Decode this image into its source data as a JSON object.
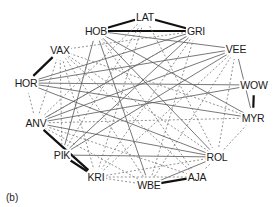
{
  "figure": {
    "panel_label": "(b)",
    "width": 278,
    "height": 207,
    "background_color": "#ffffff"
  },
  "chart_data": {
    "type": "graph",
    "title": "",
    "subtitle": "",
    "xlabel": "",
    "ylabel": "",
    "legend": [],
    "layout": "circular",
    "grid": false,
    "node_count": 15,
    "edge_count": 55,
    "edge_styles": {
      "thick": {
        "color": "#111111",
        "width": 2.2,
        "dash": "none",
        "meaning": "strong tie"
      },
      "solid": {
        "color": "#555555",
        "width": 0.8,
        "dash": "none",
        "meaning": "medium tie"
      },
      "dashed": {
        "color": "#777777",
        "width": 0.8,
        "dash": "2,2",
        "meaning": "weak tie"
      }
    },
    "nodes": [
      {
        "id": "LAT",
        "label": "LAT",
        "x": 145,
        "y": 17
      },
      {
        "id": "HOB",
        "label": "HOB",
        "x": 96,
        "y": 31
      },
      {
        "id": "GRI",
        "label": "GRI",
        "x": 196,
        "y": 31
      },
      {
        "id": "VEE",
        "label": "VEE",
        "x": 236,
        "y": 49
      },
      {
        "id": "WOW",
        "label": "WOW",
        "x": 254,
        "y": 85
      },
      {
        "id": "MYR",
        "label": "MYR",
        "x": 253,
        "y": 118
      },
      {
        "id": "ROL",
        "label": "ROL",
        "x": 217,
        "y": 157
      },
      {
        "id": "AJA",
        "label": "AJA",
        "x": 197,
        "y": 177
      },
      {
        "id": "WBE",
        "label": "WBE",
        "x": 149,
        "y": 185
      },
      {
        "id": "KRI",
        "label": "KRI",
        "x": 96,
        "y": 177
      },
      {
        "id": "PIK",
        "label": "PIK",
        "x": 62,
        "y": 155
      },
      {
        "id": "ANV",
        "label": "ANV",
        "x": 36,
        "y": 123
      },
      {
        "id": "HOR",
        "label": "HOR",
        "x": 26,
        "y": 83
      },
      {
        "id": "VAX",
        "label": "VAX",
        "x": 60,
        "y": 50
      },
      {
        "id": "MID",
        "label": "",
        "x": 140,
        "y": 118
      }
    ],
    "edges": [
      {
        "source": "LAT",
        "target": "HOB",
        "style": "thick"
      },
      {
        "source": "LAT",
        "target": "GRI",
        "style": "thick"
      },
      {
        "source": "HOB",
        "target": "GRI",
        "style": "thick"
      },
      {
        "source": "VAX",
        "target": "HOR",
        "style": "thick"
      },
      {
        "source": "WOW",
        "target": "MYR",
        "style": "thick"
      },
      {
        "source": "ANV",
        "target": "KRI",
        "style": "thick"
      },
      {
        "source": "PIK",
        "target": "KRI",
        "style": "thick"
      },
      {
        "source": "WBE",
        "target": "AJA",
        "style": "thick"
      },
      {
        "source": "HOB",
        "target": "VEE",
        "style": "solid"
      },
      {
        "source": "HOB",
        "target": "MYR",
        "style": "solid"
      },
      {
        "source": "HOB",
        "target": "ROL",
        "style": "solid"
      },
      {
        "source": "HOB",
        "target": "WBE",
        "style": "solid"
      },
      {
        "source": "GRI",
        "target": "ANV",
        "style": "solid"
      },
      {
        "source": "GRI",
        "target": "PIK",
        "style": "solid"
      },
      {
        "source": "GRI",
        "target": "HOR",
        "style": "solid"
      },
      {
        "source": "VEE",
        "target": "ANV",
        "style": "solid"
      },
      {
        "source": "VEE",
        "target": "HOR",
        "style": "solid"
      },
      {
        "source": "VEE",
        "target": "MYR",
        "style": "solid"
      },
      {
        "source": "VEE",
        "target": "PIK",
        "style": "solid"
      },
      {
        "source": "WOW",
        "target": "HOR",
        "style": "solid"
      },
      {
        "source": "WOW",
        "target": "ANV",
        "style": "solid"
      },
      {
        "source": "MYR",
        "target": "ANV",
        "style": "dashed"
      },
      {
        "source": "ROL",
        "target": "PIK",
        "style": "solid"
      },
      {
        "source": "ROL",
        "target": "ANV",
        "style": "solid"
      },
      {
        "source": "ROL",
        "target": "KRI",
        "style": "dashed"
      },
      {
        "source": "ROL",
        "target": "WBE",
        "style": "solid"
      },
      {
        "source": "ROL",
        "target": "AJA",
        "style": "dashed"
      },
      {
        "source": "ROL",
        "target": "VEE",
        "style": "dashed"
      },
      {
        "source": "ROL",
        "target": "MYR",
        "style": "dashed"
      },
      {
        "source": "AJA",
        "target": "KRI",
        "style": "dashed"
      },
      {
        "source": "AJA",
        "target": "VAX",
        "style": "dashed"
      },
      {
        "source": "AJA",
        "target": "HOB",
        "style": "dashed"
      },
      {
        "source": "WBE",
        "target": "KRI",
        "style": "dashed"
      },
      {
        "source": "WBE",
        "target": "VAX",
        "style": "dashed"
      },
      {
        "source": "WBE",
        "target": "GRI",
        "style": "dashed"
      },
      {
        "source": "WBE",
        "target": "VEE",
        "style": "dashed"
      },
      {
        "source": "KRI",
        "target": "VAX",
        "style": "dashed"
      },
      {
        "source": "KRI",
        "target": "LAT",
        "style": "dashed"
      },
      {
        "source": "KRI",
        "target": "VEE",
        "style": "dashed"
      },
      {
        "source": "PIK",
        "target": "VAX",
        "style": "dashed"
      },
      {
        "source": "PIK",
        "target": "LAT",
        "style": "dashed"
      },
      {
        "source": "PIK",
        "target": "HOB",
        "style": "solid"
      },
      {
        "source": "ANV",
        "target": "HOR",
        "style": "dashed"
      },
      {
        "source": "ANV",
        "target": "VAX",
        "style": "dashed"
      },
      {
        "source": "ANV",
        "target": "GRI",
        "style": "dashed"
      },
      {
        "source": "ANV",
        "target": "AJA",
        "style": "dashed"
      },
      {
        "source": "ANV",
        "target": "WBE",
        "style": "dashed"
      },
      {
        "source": "HOR",
        "target": "ROL",
        "style": "solid"
      },
      {
        "source": "HOR",
        "target": "MYR",
        "style": "solid"
      },
      {
        "source": "VAX",
        "target": "ROL",
        "style": "dashed"
      },
      {
        "source": "VAX",
        "target": "MYR",
        "style": "dashed"
      },
      {
        "source": "VAX",
        "target": "GRI",
        "style": "dashed"
      },
      {
        "source": "LAT",
        "target": "ANV",
        "style": "dashed"
      },
      {
        "source": "LAT",
        "target": "ROL",
        "style": "dashed"
      },
      {
        "source": "GRI",
        "target": "KRI",
        "style": "dashed"
      }
    ]
  }
}
